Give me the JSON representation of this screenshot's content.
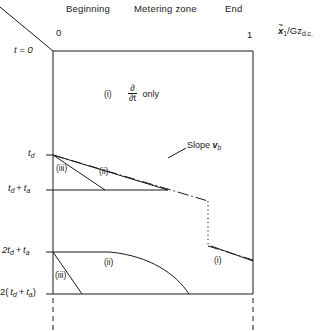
{
  "figure": {
    "type": "x-t characteristic diagram",
    "column_headings": [
      {
        "name": "beginning",
        "label": "Beginning",
        "x": 70,
        "y": 6
      },
      {
        "name": "metering-zone",
        "label": "Metering zone",
        "x": 140,
        "y": 6
      },
      {
        "name": "end",
        "label": "End",
        "x": 228,
        "y": 6
      }
    ],
    "x_axis": {
      "label_tilde": "~",
      "label_main": "x",
      "label_sub": "1",
      "label_denominator": "/Gz",
      "label_denominator_sub": "d.c.",
      "ticks": [
        {
          "name": "x-tick-0",
          "label": "0",
          "x": 56,
          "y": 30
        },
        {
          "name": "x-tick-1",
          "label": "1",
          "x": 247,
          "y": 30
        }
      ]
    },
    "y_axis": {
      "ticks": [
        {
          "name": "t-tick-zero",
          "label": "t = 0",
          "y": 47
        },
        {
          "name": "t-tick-td",
          "label": "t_d",
          "y": 150
        },
        {
          "name": "t-tick-td-ta",
          "label": "t_d + t_a",
          "y": 186
        },
        {
          "name": "t-tick-2td-ta",
          "label": "2 t_d + t_a",
          "y": 248
        },
        {
          "name": "t-tick-2td-ta-paren",
          "label": "2( t_d + t_a )",
          "y": 289
        }
      ]
    },
    "region_labels": [
      {
        "name": "region-i-top",
        "text": "(i)",
        "x": 106,
        "y": 94
      },
      {
        "name": "region-iii-mid",
        "text": "(iii)",
        "x": 57,
        "y": 168
      },
      {
        "name": "region-ii-mid",
        "text": "(ii)",
        "x": 99,
        "y": 171
      },
      {
        "name": "region-iii-lower",
        "text": "(iii)",
        "x": 55,
        "y": 275
      },
      {
        "name": "region-ii-lower",
        "text": "(ii)",
        "x": 104,
        "y": 262
      },
      {
        "name": "region-i-lower",
        "text": "(i)",
        "x": 214,
        "y": 260
      }
    ],
    "annotations": [
      {
        "name": "partial-dt-note",
        "prefix": "",
        "numerator": "∂",
        "denominator": "∂t",
        "suffix": "only",
        "x": 129,
        "y": 88
      },
      {
        "name": "slope-vb-note",
        "text_main": "Slope ",
        "text_var": "v",
        "text_sub": "b",
        "x": 189,
        "y": 147
      }
    ],
    "colors": {
      "line": "#1a1a1a",
      "background": "#ffffff",
      "text": "#1a1a1a"
    },
    "geometry": {
      "box": {
        "left": 53,
        "top": 51,
        "right": 253,
        "bottom": 294
      }
    }
  }
}
